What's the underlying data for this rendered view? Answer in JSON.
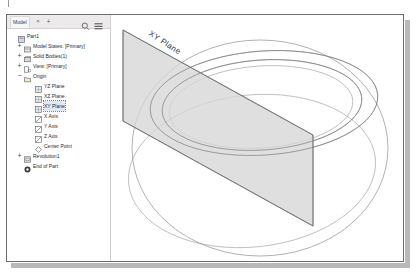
{
  "window": {
    "title": "Model Browser",
    "accent_color": "#dfe9f6",
    "frame_color": "#6e6e6e"
  },
  "browser": {
    "toolbar": {
      "tab_label": "Model",
      "close_label": "×",
      "add_label": "+",
      "search_icon": "search-icon",
      "menu_icon": "hamburger-menu-icon"
    },
    "tree": [
      {
        "label": "Part1",
        "depth": 0,
        "expander": "",
        "icon": "part-document-icon",
        "selected": false
      },
      {
        "label": "Model States: [Primary]",
        "depth": 1,
        "expander": "+",
        "icon": "model-states-icon",
        "selected": false
      },
      {
        "label": "Solid Bodies(1)",
        "depth": 1,
        "expander": "+",
        "icon": "solid-bodies-icon",
        "selected": false
      },
      {
        "label": "View: [Primary]",
        "depth": 1,
        "expander": "+",
        "icon": "view-icon",
        "selected": false
      },
      {
        "label": "Origin",
        "depth": 1,
        "expander": "−",
        "icon": "origin-folder-icon",
        "selected": false
      },
      {
        "label": "YZ Plane",
        "depth": 2,
        "expander": "",
        "icon": "plane-icon",
        "selected": false
      },
      {
        "label": "XZ Plane",
        "depth": 2,
        "expander": "",
        "icon": "plane-icon",
        "selected": false
      },
      {
        "label": "XY Plane",
        "depth": 2,
        "expander": "",
        "icon": "plane-icon",
        "selected": true
      },
      {
        "label": "X Axis",
        "depth": 2,
        "expander": "",
        "icon": "axis-icon",
        "selected": false
      },
      {
        "label": "Y Axis",
        "depth": 2,
        "expander": "",
        "icon": "axis-icon",
        "selected": false
      },
      {
        "label": "Z Axis",
        "depth": 2,
        "expander": "",
        "icon": "axis-icon",
        "selected": false
      },
      {
        "label": "Center Point",
        "depth": 2,
        "expander": "",
        "icon": "center-point-icon",
        "selected": false
      },
      {
        "label": "Revolution1",
        "depth": 1,
        "expander": "+",
        "icon": "revolution-icon",
        "selected": false
      },
      {
        "label": "End of Part",
        "depth": 1,
        "expander": "",
        "icon": "end-of-part-icon",
        "selected": false
      }
    ]
  },
  "viewport": {
    "plane_label": "XY Plane",
    "plane_fill": "#d5d5d5",
    "edge_color": "#8a8a8a",
    "background": "#ffffff"
  }
}
